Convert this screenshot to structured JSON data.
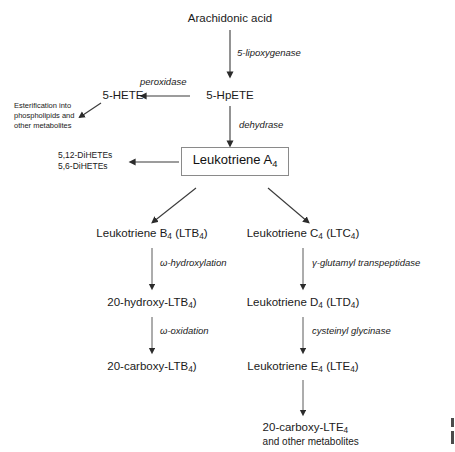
{
  "diagram": {
    "title_node": "Arachidonic acid",
    "nodes": {
      "arachidonic_acid": "Arachidonic acid",
      "hpete": "5-HpETE",
      "hete": "5-HETE",
      "esterification_l1": "Esterification into",
      "esterification_l2": "phospholipids and",
      "esterification_l3": "other metabolites",
      "dihetes_l1": "5,12-DiHETEs",
      "dihetes_l2": "5,6-DiHETEs",
      "ltb4": "Leukotriene B",
      "ltb4_sub": "4",
      "ltb4_paren": " (LTB",
      "ltb4_paren_sub": "4",
      "ltb4_close": ")",
      "ltc4": "Leukotriene C",
      "hydroxy_ltb4": "20-hydroxy-LTB",
      "hydroxy_ltb4_tail": ")",
      "carboxy_ltb4": "20-carboxy-LTB",
      "carboxy_ltb4_tail": ")",
      "ltd4": "Leukotriene D",
      "lte4": "Leukotriene E",
      "carboxy_lte4": "20-carboxy-LTE",
      "carboxy_lte4_note": "and other metabolites",
      "lta4_box": "Leukotriene A",
      "subscript4": "4"
    },
    "enzymes": {
      "lipoxygenase": "5-lipoxygenase",
      "peroxidase": "peroxidase",
      "dehydrase": "dehydrase",
      "omega_hydroxylation": "ω-hydroxylation",
      "omega_oxidation": "ω-oxidation",
      "glutamyl": "γ-glutamyl transpeptidase",
      "cysteinyl": "cysteinyl glycinase"
    },
    "labels": {
      "ltb_prefix": "Leukotriene B",
      "ltc_prefix": "Leukotriene C",
      "ltd_prefix": "Leukotriene D",
      "lte_prefix": "Leukotriene E",
      "paren_ltb": "(LTB",
      "paren_ltc": "(LTC",
      "paren_ltd": "(LTD",
      "paren_lte": "(LTE"
    },
    "colors": {
      "text": "#1a1a1a",
      "line": "#3a3a3a",
      "box_border": "#8a8a8a",
      "background": "#ffffff"
    }
  }
}
